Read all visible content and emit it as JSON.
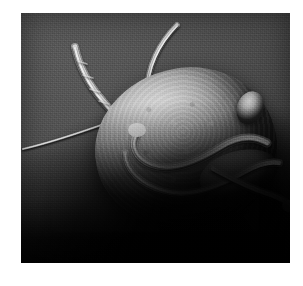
{
  "page": {
    "background_color": "#ffffff",
    "width": 303,
    "height": 286
  },
  "figure": {
    "name": "sem-micrograph",
    "type": "scanning-electron-micrograph",
    "color_mode": "grayscale",
    "caption": "",
    "frame": {
      "left": 21,
      "top": 13,
      "width": 269,
      "height": 250
    },
    "palette": {
      "background": "#4b4b4b",
      "background_dark": "#151515",
      "shadow": "#000000",
      "specimen_highlight": "#cfcfcf",
      "specimen_midtone": "#8c8c8c",
      "specimen_shadow": "#3a3a3a",
      "flagella": "#efefef"
    },
    "subject": {
      "label": "flagellated protozoan cell",
      "parts": [
        {
          "name": "cell-body",
          "label": "pear-shaped cell body",
          "tone": "light gray, granular"
        },
        {
          "name": "dorsal-highlight",
          "label": "dorsal dome highlight",
          "tone": "bright gray"
        },
        {
          "name": "posterior-knob",
          "label": "small rounded knob at upper right margin",
          "tone": "mid gray"
        },
        {
          "name": "ventral-lip",
          "label": "ventral disc rim at lower right",
          "tone": "mid gray"
        },
        {
          "name": "anterior-flagellum",
          "label": "long flagellum arcing up from the top of the cell",
          "tone": "bright"
        },
        {
          "name": "segmented-appendage",
          "label": "segmented appendage extending to the upper left",
          "tone": "bright"
        },
        {
          "name": "lateral-filament",
          "label": "thin straight filament reaching the left edge",
          "tone": "bright thin"
        },
        {
          "name": "ventral-flagellum-pair",
          "label": "pair of flagella curving across the ventral face",
          "tone": "bright"
        },
        {
          "name": "caudal-flagellum",
          "label": "trailing flagellum at the lower right",
          "tone": "bright"
        }
      ]
    }
  }
}
